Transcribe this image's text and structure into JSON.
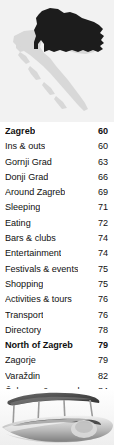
{
  "header": {
    "map": {
      "icon": "croatia-map",
      "country": "Croatia",
      "highlighted_region": "Northern Croatia / Zagreb",
      "colors": {
        "background": "#f2f2f2",
        "country_fill": "#d6d6d6",
        "highlight_fill": "#1c1c1c"
      }
    }
  },
  "toc": {
    "entries": [
      {
        "label": "Zagreb",
        "page": "60",
        "header": true
      },
      {
        "label": "Ins & outs",
        "page": "60",
        "header": false
      },
      {
        "label": "Gornji Grad",
        "page": "63",
        "header": false
      },
      {
        "label": "Donji Grad",
        "page": "66",
        "header": false
      },
      {
        "label": "Around Zagreb",
        "page": "69",
        "header": false
      },
      {
        "label": "Sleeping",
        "page": "71",
        "header": false
      },
      {
        "label": "Eating",
        "page": "72",
        "header": false
      },
      {
        "label": "Bars & clubs",
        "page": "74",
        "header": false
      },
      {
        "label": "Entertainment",
        "page": "74",
        "header": false
      },
      {
        "label": "Festivals & events",
        "page": "75",
        "header": false
      },
      {
        "label": "Shopping",
        "page": "75",
        "header": false
      },
      {
        "label": "Activities & tours",
        "page": "76",
        "header": false
      },
      {
        "label": "Transport",
        "page": "76",
        "header": false
      },
      {
        "label": "Directory",
        "page": "78",
        "header": false
      },
      {
        "label": "North of Zagreb",
        "page": "79",
        "header": true
      },
      {
        "label": "Zagorje",
        "page": "79",
        "header": false
      },
      {
        "label": "Varaždin",
        "page": "82",
        "header": false
      },
      {
        "label": "Čakovec & around",
        "page": "84",
        "header": false
      },
      {
        "label": "Koprivnica & around",
        "page": "85",
        "header": false
      },
      {
        "label": "Listings",
        "page": "86",
        "header": false
      }
    ]
  },
  "footer": {
    "photo": {
      "icon": "boat-photo",
      "subject": "Wooden boat with canopy",
      "style": "grayscale"
    }
  }
}
